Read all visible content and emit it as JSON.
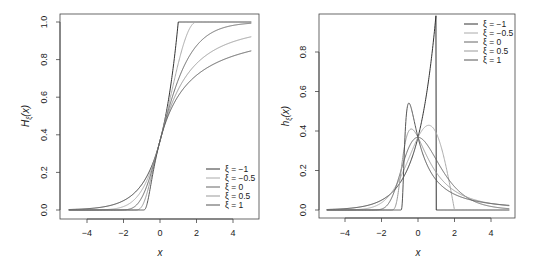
{
  "chart_data": [
    {
      "type": "line",
      "title": "",
      "xlabel": "x",
      "ylabel": "H_ξ(x)",
      "xlim": [
        -5,
        5
      ],
      "ylim": [
        0,
        1
      ],
      "x_ticks": [
        -4,
        -2,
        0,
        2,
        4
      ],
      "y_ticks": [
        "0.0",
        "0.2",
        "0.4",
        "0.6",
        "0.8",
        "1.0"
      ],
      "grid": false,
      "legend_position": "bottom-right",
      "function": "GEV CDF H_xi(x) = exp(-(1+xi*x)^(-1/xi))",
      "series": [
        {
          "name": "ξ = −1",
          "xi": -1,
          "color": "#333333",
          "points": [
            [
              -5,
              0
            ],
            [
              -1,
              0.0
            ],
            [
              -0.5,
              0.223
            ],
            [
              0,
              0.368
            ],
            [
              0.5,
              0.607
            ],
            [
              1,
              1.0
            ],
            [
              2,
              1.0
            ]
          ]
        },
        {
          "name": "ξ = −0.5",
          "xi": -0.5,
          "color": "#aaaaaa",
          "points": [
            [
              -5,
              0
            ],
            [
              -1,
              0.0
            ],
            [
              -0.5,
              0.209
            ],
            [
              0,
              0.368
            ],
            [
              0.5,
              0.57
            ],
            [
              1,
              0.779
            ],
            [
              2,
              1.0
            ]
          ]
        },
        {
          "name": "ξ = 0",
          "xi": 0,
          "color": "#666666",
          "points": [
            [
              -5,
              0.0
            ],
            [
              -2,
              0.0006
            ],
            [
              -1,
              0.066
            ],
            [
              0,
              0.368
            ],
            [
              1,
              0.692
            ],
            [
              2,
              0.873
            ],
            [
              3,
              0.951
            ],
            [
              5,
              0.993
            ]
          ]
        },
        {
          "name": "ξ = 0.5",
          "xi": 0.5,
          "color": "#999999",
          "points": [
            [
              -2,
              0
            ],
            [
              -1,
              0.018
            ],
            [
              0,
              0.368
            ],
            [
              1,
              0.641
            ],
            [
              2,
              0.779
            ],
            [
              3,
              0.852
            ],
            [
              5,
              0.922
            ]
          ]
        },
        {
          "name": "ξ = 1",
          "xi": 1,
          "color": "#555555",
          "points": [
            [
              -1,
              0
            ],
            [
              -0.5,
              0.135
            ],
            [
              0,
              0.368
            ],
            [
              1,
              0.607
            ],
            [
              2,
              0.717
            ],
            [
              3,
              0.779
            ],
            [
              5,
              0.846
            ]
          ]
        }
      ]
    },
    {
      "type": "line",
      "title": "",
      "xlabel": "x",
      "ylabel": "h_ξ(x)",
      "xlim": [
        -5,
        5
      ],
      "ylim": [
        0,
        0.95
      ],
      "x_ticks": [
        -4,
        -2,
        0,
        2,
        4
      ],
      "y_ticks": [
        "0.0",
        "0.2",
        "0.4",
        "0.6",
        "0.8"
      ],
      "grid": false,
      "legend_position": "top-right",
      "function": "GEV density h_xi(x)",
      "series": [
        {
          "name": "ξ = −1",
          "xi": -1,
          "color": "#333333",
          "points": [
            [
              -5,
              0
            ],
            [
              -1,
              0.0
            ],
            [
              0,
              0.368
            ],
            [
              0.5,
              0.607
            ],
            [
              1,
              1.0
            ],
            [
              1,
              0
            ]
          ]
        },
        {
          "name": "ξ = −0.5",
          "xi": -0.5,
          "color": "#aaaaaa",
          "points": [
            [
              -1,
              0.0
            ],
            [
              -0.5,
              0.39
            ],
            [
              0,
              0.368
            ],
            [
              0.6,
              0.43
            ],
            [
              1.5,
              0.29
            ],
            [
              2,
              0
            ]
          ]
        },
        {
          "name": "ξ = 0",
          "xi": 0,
          "color": "#666666",
          "points": [
            [
              -3,
              0.0
            ],
            [
              -1,
              0.179
            ],
            [
              0,
              0.368
            ],
            [
              1,
              0.254
            ],
            [
              2,
              0.118
            ],
            [
              5,
              0.007
            ]
          ]
        },
        {
          "name": "ξ = 0.5",
          "xi": 0.5,
          "color": "#999999",
          "points": [
            [
              -2,
              0
            ],
            [
              -1,
              0.14
            ],
            [
              -0.4,
              0.41
            ],
            [
              0,
              0.368
            ],
            [
              1,
              0.18
            ],
            [
              5,
              0.015
            ]
          ]
        },
        {
          "name": "ξ = 1",
          "xi": 1,
          "color": "#555555",
          "points": [
            [
              -1,
              0
            ],
            [
              -0.5,
              0.54
            ],
            [
              0,
              0.368
            ],
            [
              1,
              0.152
            ],
            [
              5,
              0.024
            ]
          ]
        }
      ]
    }
  ],
  "panels": [
    {
      "ylabel_main": "H",
      "ylabel_sub": "ξ",
      "ylabel_arg": "(x)",
      "xlabel": "x",
      "x_tick_labels": [
        "−4",
        "−2",
        "0",
        "2",
        "4"
      ],
      "y_tick_labels": [
        "0.0",
        "0.2",
        "0.4",
        "0.6",
        "0.8",
        "1.0"
      ],
      "legend": [
        "ξ = −1",
        "ξ = −0.5",
        "ξ = 0",
        "ξ = 0.5",
        "ξ = 1"
      ]
    },
    {
      "ylabel_main": "h",
      "ylabel_sub": "ξ",
      "ylabel_arg": "(x)",
      "xlabel": "x",
      "x_tick_labels": [
        "−4",
        "−2",
        "0",
        "2",
        "4"
      ],
      "y_tick_labels": [
        "0.0",
        "0.2",
        "0.4",
        "0.6",
        "0.8"
      ],
      "legend": [
        "ξ = −1",
        "ξ = −0.5",
        "ξ = 0",
        "ξ = 0.5",
        "ξ = 1"
      ]
    }
  ]
}
